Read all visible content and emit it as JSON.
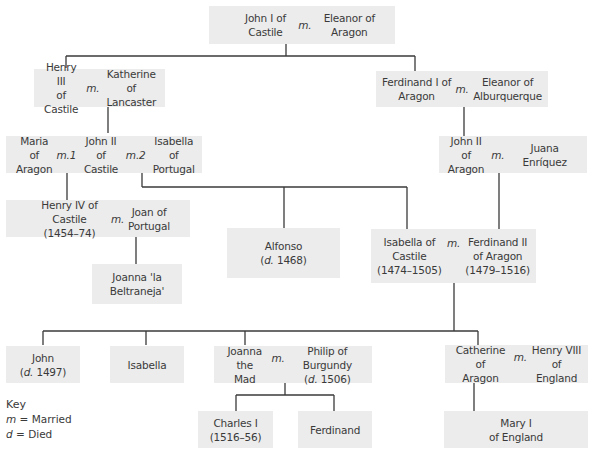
{
  "colors": {
    "box_fill": "#ececec",
    "line": "#3a3a3a",
    "text": "#3a3a3a",
    "background": "#ffffff"
  },
  "tree": {
    "john_i_castile": {
      "left": "John I of\nCastile",
      "marker": "m.",
      "right": "Eleanor of\nAragon"
    },
    "henry_iii": {
      "left": "Henry III\nof Castile",
      "marker": "m.",
      "right": "Katherine of\nLancaster"
    },
    "ferdinand_i": {
      "left": "Ferdinand I of\nAragon",
      "marker": "m.",
      "right": "Eleanor of\nAlburquerque"
    },
    "john_ii_castile": {
      "left": "Maria of\nAragon",
      "marker1": "m.1",
      "center": "John II\nof Castile",
      "marker2": "m.2",
      "right": "Isabella\nof Portugal"
    },
    "john_ii_aragon": {
      "left": "John II of\nAragon",
      "marker": "m.",
      "right": "Juana Enríquez"
    },
    "henry_iv": {
      "left": "Henry IV of Castile\n(1454–74)",
      "marker": "m.",
      "right": "Joan of\nPortugal"
    },
    "joanna_beltraneja": {
      "name": "Joanna 'la\nBeltraneja'"
    },
    "alfonso": {
      "name": "Alfonso",
      "died_prefix": "d.",
      "died_year": " 1468"
    },
    "isabella_ferdinand": {
      "left": "Isabella of\nCastile\n(1474–1505)",
      "marker": "m.",
      "right": "Ferdinand II\nof Aragon\n(1479–1516)"
    },
    "john": {
      "name": "John",
      "died_prefix": "d.",
      "died_year": " 1497"
    },
    "isabella": {
      "name": "Isabella"
    },
    "joanna_mad": {
      "left": "Joanna the\nMad",
      "marker": "m.",
      "right_name": "Philip of Burgundy",
      "right_died_prefix": "d.",
      "right_died_year": " 1506"
    },
    "catherine": {
      "left": "Catherine of\nAragon",
      "marker": "m.",
      "right": "Henry VIII\nof England"
    },
    "charles_i": {
      "name": "Charles I\n(1516–56)"
    },
    "ferdinand": {
      "name": "Ferdinand"
    },
    "mary_i": {
      "name": "Mary I\nof England"
    }
  },
  "key": {
    "title": "Key",
    "items": [
      {
        "symbol": "m",
        "meaning": "= Married"
      },
      {
        "symbol": "d",
        "meaning": "= Died"
      }
    ]
  }
}
